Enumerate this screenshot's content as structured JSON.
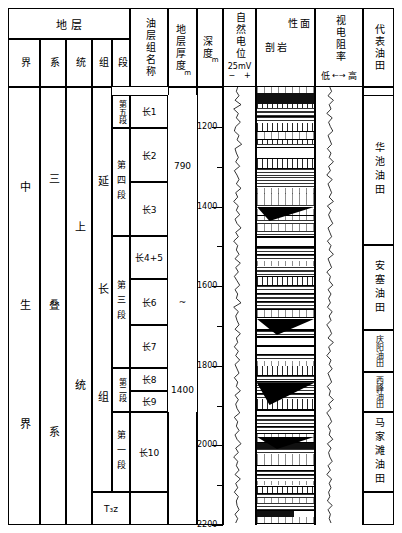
{
  "header": {
    "strata_group": "地            层",
    "cols": [
      {
        "key": "jie",
        "label": "界"
      },
      {
        "key": "xi",
        "label": "系"
      },
      {
        "key": "tong",
        "label": "统"
      },
      {
        "key": "zu",
        "label": "组"
      },
      {
        "key": "duan",
        "label": "段"
      }
    ],
    "oil_group_name": "油层组名称",
    "thickness": "地层厚度",
    "thickness_unit": "m",
    "depth": "深度",
    "depth_unit": "m",
    "sp": "自然电位",
    "sp_scale": "25mV",
    "sp_minus": "−",
    "sp_plus": "+",
    "lithology": "岩性剖面",
    "lithology_a": "岩",
    "lithology_b": "性",
    "lithology_c": "剖",
    "lithology_d": "面",
    "resistivity": "视电阻率",
    "resistivity_low": "低",
    "resistivity_arrow": "←→",
    "resistivity_high": "高",
    "oilfield": "代表油田"
  },
  "strata": {
    "jie": "中生界",
    "jie_a": "中",
    "jie_b": "生",
    "jie_c": "界",
    "xi": "三叠系",
    "xi_a": "三",
    "xi_b": "叠",
    "xi_c": "系",
    "tong_upper": "上",
    "tong_lower": "统",
    "zu_upper": "延",
    "zu_mid": "长",
    "zu_lower": "组",
    "zu_bottom": "T₃z",
    "duan": [
      {
        "label": "第五段",
        "top": 95,
        "bottom": 128
      },
      {
        "label": "第四段",
        "top": 128,
        "bottom": 236
      },
      {
        "label": "第三段",
        "top": 236,
        "bottom": 368
      },
      {
        "label": "第二段",
        "top": 368,
        "bottom": 412
      },
      {
        "label": "第一段",
        "top": 412,
        "bottom": 492
      }
    ]
  },
  "oil_groups": [
    {
      "label": "长1",
      "top": 95,
      "bottom": 128
    },
    {
      "label": "长2",
      "top": 128,
      "bottom": 182
    },
    {
      "label": "长3",
      "top": 182,
      "bottom": 236
    },
    {
      "label": "长4+5",
      "top": 236,
      "bottom": 279
    },
    {
      "label": "长6",
      "top": 279,
      "bottom": 325
    },
    {
      "label": "长7",
      "top": 325,
      "bottom": 368
    },
    {
      "label": "长8",
      "top": 368,
      "bottom": 391
    },
    {
      "label": "长9",
      "top": 391,
      "bottom": 412
    },
    {
      "label": "长10",
      "top": 412,
      "bottom": 492
    }
  ],
  "thickness_values": [
    {
      "label": "790",
      "top": 95,
      "bottom": 236
    },
    {
      "label": "~",
      "top": 236,
      "bottom": 368
    },
    {
      "label": "1400",
      "top": 368,
      "bottom": 412
    }
  ],
  "oilfields": [
    {
      "label": "华池油田",
      "top": 95,
      "bottom": 245
    },
    {
      "label": "安塞油田",
      "top": 245,
      "bottom": 330
    },
    {
      "label": "庆阳油田",
      "top": 330,
      "bottom": 372
    },
    {
      "label": "西峰油田",
      "top": 372,
      "bottom": 412
    },
    {
      "label": "马家滩油田",
      "top": 412,
      "bottom": 492
    }
  ],
  "chart_data": {
    "type": "table",
    "ylabel": "深度 m",
    "ylim": [
      1100,
      2200
    ],
    "depth_ticks_major": [
      1200,
      1400,
      1600,
      1800,
      2000,
      2200
    ],
    "depth_ticks_minor": [
      1100,
      1300,
      1500,
      1700,
      1900,
      2100
    ],
    "columns": [
      "界",
      "系",
      "统",
      "组",
      "段",
      "油层组名称",
      "地层厚度 m",
      "深度 m",
      "自然电位",
      "岩性剖面",
      "视电阻率",
      "代表油田"
    ],
    "series": [
      {
        "name": "自然电位 (SP)",
        "unit": "mV",
        "scale_label": "25mV",
        "polarity": [
          "−",
          "+"
        ],
        "values": [
          48,
          44,
          52,
          40,
          58,
          36,
          50,
          44,
          56,
          42,
          38,
          52,
          46,
          60,
          40,
          44,
          50,
          42,
          54,
          38,
          46,
          52,
          44,
          58,
          42,
          48,
          36,
          50,
          44,
          54,
          40,
          46,
          58,
          42,
          50,
          36,
          48,
          44,
          52,
          40,
          56,
          42,
          50,
          38,
          46,
          54,
          40,
          48,
          44,
          58,
          36,
          50,
          42,
          46,
          52,
          40,
          56,
          44,
          48,
          38,
          50,
          42,
          54,
          40,
          46,
          52,
          38,
          48,
          44,
          56,
          40,
          50,
          42,
          46,
          54,
          38,
          48,
          44,
          52,
          40,
          46,
          58,
          42,
          50,
          36,
          48,
          44,
          52,
          40,
          56,
          42,
          48,
          38,
          50,
          44,
          46,
          52,
          40,
          48,
          42
        ]
      },
      {
        "name": "视电阻率 (RT)",
        "direction": "低←→高",
        "values": [
          46,
          52,
          40,
          58,
          44,
          50,
          36,
          54,
          42,
          48,
          56,
          40,
          46,
          52,
          38,
          50,
          44,
          58,
          42,
          48,
          36,
          54,
          40,
          46,
          52,
          44,
          58,
          38,
          50,
          42,
          48,
          56,
          40,
          46,
          52,
          38,
          50,
          44,
          58,
          40,
          46,
          52,
          36,
          48,
          44,
          56,
          40,
          50,
          42,
          48,
          38,
          54,
          44,
          50,
          36,
          46,
          52,
          40,
          58,
          42,
          48,
          36,
          50,
          44,
          54,
          40,
          46,
          52,
          38,
          48,
          44,
          58,
          42,
          50,
          36,
          46,
          52,
          40,
          48,
          44,
          56,
          38,
          50,
          42,
          46,
          54,
          40,
          48,
          36,
          52,
          44,
          50,
          42,
          46,
          38,
          54,
          40,
          48,
          44,
          50
        ]
      }
    ],
    "lithology_legend": [
      "泥岩",
      "砂岩",
      "粉砂岩",
      "煤线"
    ]
  }
}
